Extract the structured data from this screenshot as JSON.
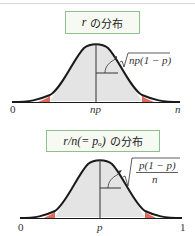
{
  "diagram": {
    "panels": [
      {
        "title_math": "r",
        "title_text": "の分布",
        "axis_labels": {
          "left": "0",
          "center": "np",
          "right": "n"
        },
        "sd_label": "√np(1 − p)",
        "sd_label_radicand": "np(1 − p)"
      },
      {
        "title_math": "r/n(= pₒ)",
        "title_text": "の分布",
        "axis_labels": {
          "left": "0",
          "center": "p",
          "right": "1"
        },
        "sd_label_numerator": "p(1 − p)",
        "sd_label_denominator": "n"
      }
    ],
    "colors": {
      "curve": "#1a1a1a",
      "fill": "#e4e4e4",
      "tail": "#e0685a",
      "title_border": "#8dc08d",
      "title_bg": "#f6faf2"
    }
  }
}
